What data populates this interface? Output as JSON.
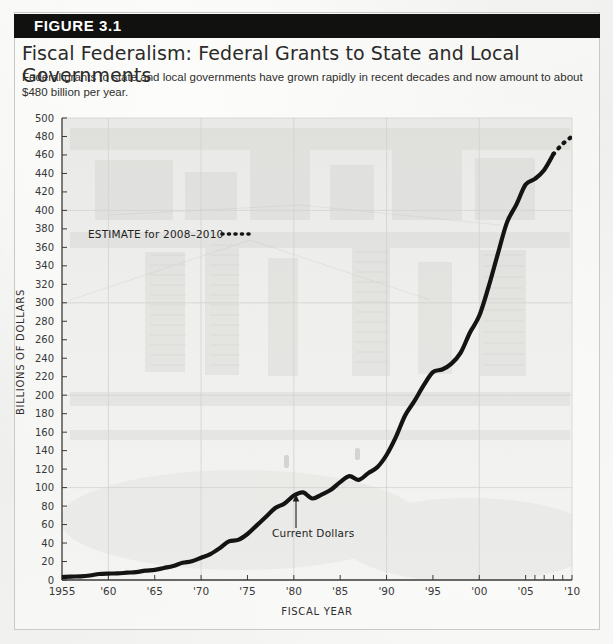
{
  "figure": {
    "banner_label": "FIGURE 3.1",
    "title": "Fiscal Federalism: Federal Grants to State and Local Governments",
    "caption": "Federal grants to state and local governments have grown rapidly in recent decades and now amount to about $480 billion per year."
  },
  "chart_data": {
    "type": "line",
    "title": "Fiscal Federalism: Federal Grants to State and Local Governments",
    "xlabel": "FISCAL YEAR",
    "ylabel": "BILLIONS OF DOLLARS",
    "xlim": [
      1955,
      2010
    ],
    "ylim": [
      0,
      500
    ],
    "ytick_step": 20,
    "grid": true,
    "legend_position": "none",
    "x_tick_labels": [
      "1955",
      "'60",
      "'65",
      "'70",
      "'75",
      "'80",
      "'85",
      "'90",
      "'95",
      "'00",
      "'05",
      "'10"
    ],
    "x_tick_values": [
      1955,
      1960,
      1965,
      1970,
      1975,
      1980,
      1985,
      1990,
      1995,
      2000,
      2005,
      2010
    ],
    "y_tick_labels": [
      "0",
      "20",
      "40",
      "60",
      "80",
      "100",
      "120",
      "140",
      "160",
      "180",
      "200",
      "220",
      "240",
      "260",
      "280",
      "300",
      "320",
      "340",
      "360",
      "380",
      "400",
      "420",
      "440",
      "460",
      "480",
      "500"
    ],
    "y_tick_values": [
      0,
      20,
      40,
      60,
      80,
      100,
      120,
      140,
      160,
      180,
      200,
      220,
      240,
      260,
      280,
      300,
      320,
      340,
      360,
      380,
      400,
      420,
      440,
      460,
      480,
      500
    ],
    "annotations": [
      {
        "name": "estimate-note",
        "text": "ESTIMATE for 2008–2010",
        "x": 1966.5,
        "y": 366
      },
      {
        "name": "current-dollars-note",
        "text": "Current Dollars",
        "x": 1980.2,
        "y": 48
      }
    ],
    "series": [
      {
        "name": "Current Dollars",
        "style": "solid",
        "x": [
          1955,
          1956,
          1957,
          1958,
          1959,
          1960,
          1961,
          1962,
          1963,
          1964,
          1965,
          1966,
          1967,
          1968,
          1969,
          1970,
          1971,
          1972,
          1973,
          1974,
          1975,
          1976,
          1977,
          1978,
          1979,
          1980,
          1981,
          1982,
          1983,
          1984,
          1985,
          1986,
          1987,
          1988,
          1989,
          1990,
          1991,
          1992,
          1993,
          1994,
          1995,
          1996,
          1997,
          1998,
          1999,
          2000,
          2001,
          2002,
          2003,
          2004,
          2005,
          2006,
          2007,
          2008
        ],
        "values": [
          3.2,
          3.7,
          4.0,
          4.9,
          6.5,
          7.0,
          7.1,
          7.9,
          8.6,
          10.1,
          10.9,
          13.0,
          15.2,
          18.6,
          20.3,
          24.1,
          28.1,
          34.4,
          41.8,
          43.4,
          49.8,
          59.1,
          68.4,
          77.9,
          82.9,
          91.4,
          94.8,
          88.2,
          92.5,
          97.6,
          105.9,
          112.4,
          108.4,
          115.4,
          122.0,
          135.3,
          154.6,
          178.1,
          193.6,
          210.6,
          225.0,
          227.8,
          234.2,
          246.1,
          267.9,
          285.9,
          317.2,
          352.9,
          387.3,
          406.3,
          428.0,
          434.1,
          443.8,
          461.0
        ]
      },
      {
        "name": "Estimate 2008-2010",
        "style": "dotted",
        "x": [
          2008,
          2009,
          2010
        ],
        "values": [
          461.0,
          472.0,
          480.0
        ]
      }
    ]
  }
}
